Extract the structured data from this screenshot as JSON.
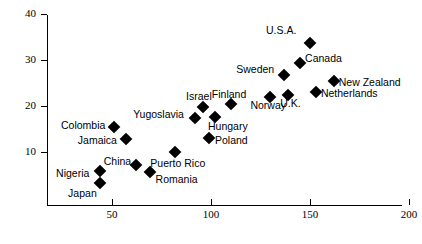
{
  "chart_data": {
    "type": "scatter",
    "title": "",
    "xlabel": "",
    "ylabel": "",
    "xlim": [
      25,
      204
    ],
    "ylim": [
      0,
      41
    ],
    "xticks": [
      50,
      100,
      150,
      200
    ],
    "yticks": [
      10,
      20,
      30,
      40
    ],
    "grid": false,
    "legend": null,
    "points": [
      {
        "label": "U.S.A.",
        "x": 150,
        "y": 33.7
      },
      {
        "label": "Canada",
        "x": 145,
        "y": 29.3
      },
      {
        "label": "Sweden",
        "x": 137,
        "y": 26.7
      },
      {
        "label": "New Zealand",
        "x": 162,
        "y": 25.4
      },
      {
        "label": "Netherlands",
        "x": 153,
        "y": 23.0
      },
      {
        "label": "U.K.",
        "x": 139,
        "y": 22.3
      },
      {
        "label": "Norway",
        "x": 130,
        "y": 21.9
      },
      {
        "label": "Finland",
        "x": 110,
        "y": 20.4
      },
      {
        "label": "Israel",
        "x": 96,
        "y": 19.7
      },
      {
        "label": "Hungary",
        "x": 102,
        "y": 17.7
      },
      {
        "label": "Yugoslavia",
        "x": 92,
        "y": 17.3
      },
      {
        "label": "Poland",
        "x": 99,
        "y": 13.1
      },
      {
        "label": "Colombia",
        "x": 51,
        "y": 15.5
      },
      {
        "label": "Jamaica",
        "x": 57,
        "y": 12.9
      },
      {
        "label": "Puerto Rico",
        "x": 82,
        "y": 10.1
      },
      {
        "label": "China",
        "x": 62,
        "y": 7.2
      },
      {
        "label": "Romania",
        "x": 69,
        "y": 5.7
      },
      {
        "label": "Nigeria",
        "x": 44,
        "y": 5.9
      },
      {
        "label": "Japan",
        "x": 44,
        "y": 3.3
      }
    ],
    "label_offsets": [
      {
        "label": "U.S.A.",
        "dx": -44,
        "dy": -12
      },
      {
        "label": "Canada",
        "dx": 5,
        "dy": -4
      },
      {
        "label": "Sweden",
        "dx": -48,
        "dy": -5
      },
      {
        "label": "New Zealand",
        "dx": 5,
        "dy": 2
      },
      {
        "label": "Netherlands",
        "dx": 5,
        "dy": 2
      },
      {
        "label": "U.K.",
        "dx": -8,
        "dy": 9
      },
      {
        "label": "Norway",
        "dx": -20,
        "dy": 9
      },
      {
        "label": "Finland",
        "dx": -19,
        "dy": -9
      },
      {
        "label": "Israel",
        "dx": -17,
        "dy": -10
      },
      {
        "label": "Hungary",
        "dx": -7,
        "dy": 10
      },
      {
        "label": "Yugoslavia",
        "dx": -62,
        "dy": -3
      },
      {
        "label": "Poland",
        "dx": 6,
        "dy": 3
      },
      {
        "label": "Colombia",
        "dx": -53,
        "dy": -1
      },
      {
        "label": "Jamaica",
        "dx": -48,
        "dy": 2
      },
      {
        "label": "Puerto Rico",
        "dx": -25,
        "dy": 12
      },
      {
        "label": "China",
        "dx": -32,
        "dy": -3
      },
      {
        "label": "Romania",
        "dx": 6,
        "dy": 8
      },
      {
        "label": "Nigeria",
        "dx": -44,
        "dy": 3
      },
      {
        "label": "Japan",
        "dx": -32,
        "dy": 11
      }
    ]
  },
  "axes": {
    "y_tick_labels": [
      "40",
      "30",
      "20",
      "10"
    ],
    "x_tick_labels": [
      "50",
      "100",
      "150",
      "200"
    ]
  }
}
